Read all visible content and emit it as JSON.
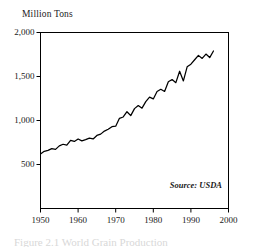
{
  "chart_data": {
    "type": "line",
    "title": "",
    "ylabel": "Million Tons",
    "xlabel": "",
    "xlim": [
      1950,
      2000
    ],
    "ylim": [
      0,
      2000
    ],
    "grid": false,
    "legend": null,
    "y_ticks": [
      "500",
      "1,000",
      "1,500",
      "2,000"
    ],
    "y_tick_values": [
      500,
      1000,
      1500,
      2000
    ],
    "x_ticks": [
      "1950",
      "1960",
      "1970",
      "1980",
      "1990",
      "2000"
    ],
    "x_tick_values": [
      1950,
      1960,
      1970,
      1980,
      1990,
      2000
    ],
    "annotation": "Source: USDA",
    "series": [
      {
        "name": "Million Tons",
        "x": [
          1950,
          1951,
          1952,
          1953,
          1954,
          1955,
          1956,
          1957,
          1958,
          1959,
          1960,
          1961,
          1962,
          1963,
          1964,
          1965,
          1966,
          1967,
          1968,
          1969,
          1970,
          1971,
          1972,
          1973,
          1974,
          1975,
          1976,
          1977,
          1978,
          1979,
          1980,
          1981,
          1982,
          1983,
          1984,
          1985,
          1986,
          1987,
          1988,
          1989,
          1990,
          1991,
          1992,
          1993,
          1994,
          1995,
          1996
        ],
        "values": [
          620,
          650,
          660,
          680,
          672,
          712,
          730,
          720,
          775,
          762,
          790,
          768,
          782,
          800,
          790,
          830,
          845,
          880,
          900,
          930,
          935,
          1025,
          1040,
          1100,
          1055,
          1135,
          1170,
          1140,
          1215,
          1265,
          1245,
          1330,
          1355,
          1330,
          1440,
          1465,
          1430,
          1560,
          1450,
          1610,
          1640,
          1690,
          1740,
          1705,
          1755,
          1715,
          1790
        ]
      }
    ]
  },
  "axes": {
    "y_title": "Million Tons",
    "source": "Source: USDA"
  },
  "caption": {
    "ghost_text": "Figure 2.1 World Grain Production"
  }
}
